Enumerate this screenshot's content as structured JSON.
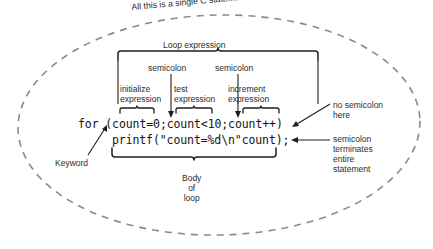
{
  "diagram": {
    "outer_caption": "All this is a single C statement.",
    "loop_expression_label": "Loop expression",
    "semicolon_label_1": "semicolon",
    "semicolon_label_2": "semicolon",
    "initialize_expression_label": "initialize\nexpression",
    "test_expression_label": "test\nexpression",
    "increment_expression_label": "increment\nexpression",
    "no_semicolon_label": "no semicolon\nhere",
    "semicolon_terminates_label": "semicolon\nterminates\nentire\nstatement",
    "keyword_label": "Keyword",
    "body_of_loop_label": "Body\nof\nloop",
    "code": {
      "line_for": "for (count=0;count<10;count++)",
      "line_printf": "printf(\"count=%d\\n\"count);"
    },
    "colors": {
      "ink": "#2b2b2b",
      "code_ink": "#141414",
      "rule": "#1e1e1e",
      "dashed_ellipse": "#8a8a8a",
      "background": "#ffffff"
    }
  }
}
